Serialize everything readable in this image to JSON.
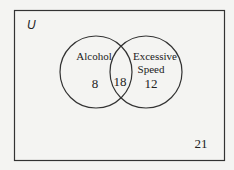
{
  "venn": {
    "universe_label": "U",
    "sets": [
      {
        "name": "Alcohol",
        "label": "Alcohol",
        "only_count": "8"
      },
      {
        "name": "Excessive Speed",
        "label_line1": "Excessive",
        "label_line2": "Speed",
        "only_count": "12"
      }
    ],
    "intersection_count": "18",
    "outside_count": "21"
  }
}
